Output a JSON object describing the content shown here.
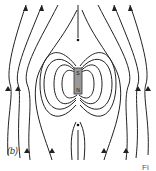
{
  "figure": {
    "panel_label": "(b)",
    "caption_fragment": "Fi",
    "magnet": {
      "top_pole": "S",
      "bottom_pole": "N",
      "color": "#999999"
    },
    "neutral_points": 2,
    "line_color": "#222222"
  }
}
